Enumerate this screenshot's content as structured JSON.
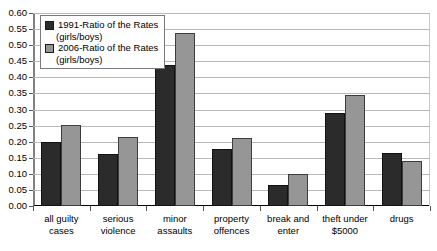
{
  "chart_data": {
    "type": "bar",
    "title": "",
    "xlabel": "",
    "ylabel": "",
    "ylim": [
      0,
      0.6
    ],
    "ytick_step": 0.05,
    "grid": true,
    "legend_position": "top-left",
    "categories": [
      "all guilty cases",
      "serious violence",
      "minor assaults",
      "property offences",
      "break and enter",
      "theft under $5000",
      "drugs"
    ],
    "ytick_labels": [
      "0.60",
      "0.55",
      "0.50",
      "0.45",
      "0.40",
      "0.35",
      "0.30",
      "0.25",
      "0.20",
      "0.15",
      "0.10",
      "0.05",
      "0.00"
    ],
    "series": [
      {
        "name": "1991-Ratio of the Rates",
        "sub": "(girls/boys)",
        "color": "#2b2b2b",
        "values": [
          0.2,
          0.162,
          0.437,
          0.177,
          0.065,
          0.288,
          0.165
        ]
      },
      {
        "name": "2006-Ratio of the Rates",
        "sub": "(girls/boys)",
        "color": "#969696",
        "values": [
          0.253,
          0.215,
          0.538,
          0.21,
          0.1,
          0.345,
          0.14
        ]
      }
    ]
  }
}
